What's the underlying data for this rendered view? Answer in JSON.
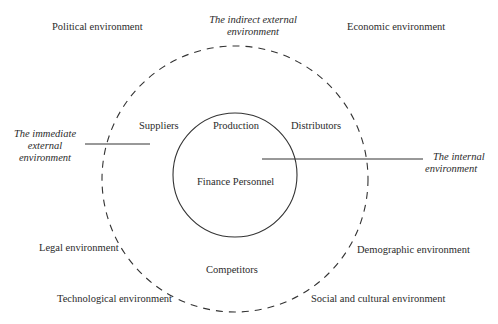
{
  "diagram": {
    "outer_labels": {
      "political": "Political environment",
      "economic": "Economic environment",
      "legal": "Legal environment",
      "demographic": "Demographic environment",
      "technological": "Technological environment",
      "social_cultural": "Social and cultural environment"
    },
    "indirect_external": {
      "line1": "The indirect external",
      "line2": "environment"
    },
    "immediate_external": {
      "line1": "The immediate",
      "line2": "external",
      "line3": "environment"
    },
    "internal": {
      "line1": "The internal",
      "line2": "environment"
    },
    "immediate_labels": {
      "suppliers": "Suppliers",
      "distributors": "Distributors",
      "competitors": "Competitors"
    },
    "internal_labels": {
      "production": "Production",
      "finance_personnel": "Finance Personnel"
    },
    "colors": {
      "line": "#333333",
      "text": "#2b2b2b",
      "background": "#ffffff"
    }
  }
}
